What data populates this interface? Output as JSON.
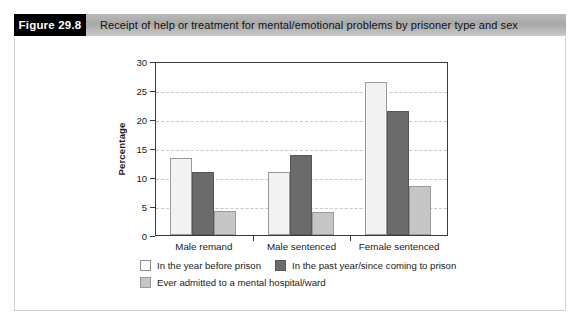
{
  "header": {
    "figure_number": "Figure 29.8",
    "caption": "Receipt of help or treatment for mental/emotional problems by prisoner type and sex"
  },
  "chart_data": {
    "type": "bar",
    "title": "",
    "xlabel": "",
    "ylabel": "Percentage",
    "ylim": [
      0,
      30
    ],
    "yticks": [
      0,
      5,
      10,
      15,
      20,
      25,
      30
    ],
    "grid": true,
    "legend_position": "bottom-left",
    "categories": [
      "Male remand",
      "Male sentenced",
      "Female sentenced"
    ],
    "series": [
      {
        "name": "In the year before prison",
        "color": "#f2f2f2",
        "values": [
          13.2,
          10.8,
          26.3
        ]
      },
      {
        "name": "In the past year/since coming to prison",
        "color": "#6b6b6b",
        "values": [
          10.9,
          13.8,
          21.3
        ]
      },
      {
        "name": "Ever admitted to a mental hospital/ward",
        "color": "#c6c6c6",
        "values": [
          4.1,
          4.0,
          8.4
        ]
      }
    ]
  }
}
